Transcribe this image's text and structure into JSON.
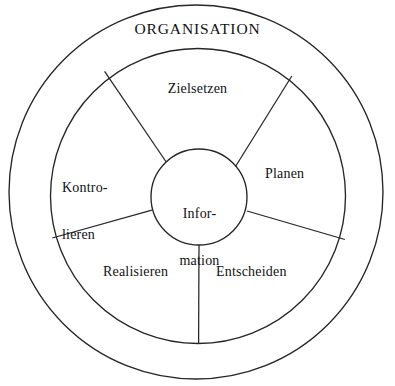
{
  "diagram": {
    "title": "ORGANISATION",
    "type": "concentric-wheel",
    "center_hub": {
      "label_line_1": "Infor-",
      "label_line_2": "mation"
    },
    "segments": [
      {
        "name": "zielsetzen",
        "label": "Zielsetzen",
        "position": "top"
      },
      {
        "name": "planen",
        "label": "Planen",
        "position": "right"
      },
      {
        "name": "entscheiden",
        "label": "Entscheiden",
        "position": "bottom-right"
      },
      {
        "name": "realisieren",
        "label": "Realisieren",
        "position": "bottom-left"
      },
      {
        "name": "kontrollieren",
        "label_line_1": "Kontro-",
        "label_line_2": "lieren",
        "position": "left"
      }
    ],
    "colors": {
      "stroke": "#262626",
      "background": "#ffffff",
      "text": "#111111"
    },
    "geometry": {
      "outer_circle": {
        "cx": 196,
        "cy": 192,
        "r": 188
      },
      "inner_ring_circle": {
        "cx": 198,
        "cy": 196,
        "r": 148
      },
      "hub_circle": {
        "cx": 199,
        "cy": 197,
        "r": 48
      }
    }
  }
}
